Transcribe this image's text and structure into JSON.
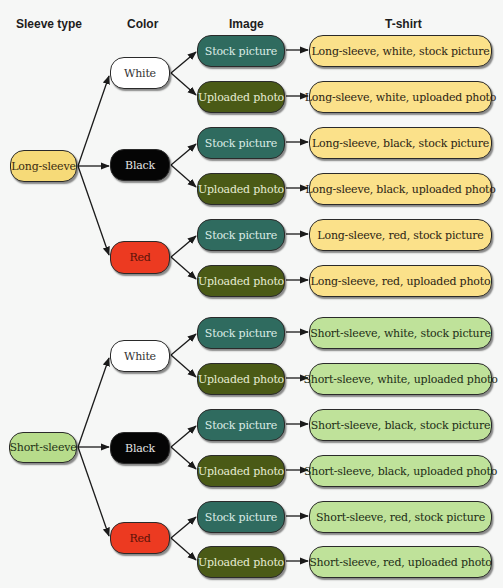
{
  "headers": {
    "sleeve_type": "Sleeve type",
    "color": "Color",
    "image": "Image",
    "tshirt": "T-shirt"
  },
  "colors_hex": {
    "long_sleeve": "#f6da78",
    "short_sleeve": "#b7dc8b",
    "white": "#ffffff",
    "black": "#050505",
    "red": "#ec3a21",
    "stock_picture": "#2f6b5f",
    "uploaded_photo": "#4a5a16"
  },
  "tree": [
    {
      "sleeve": "Long-sleeve",
      "colors": [
        {
          "color": "White",
          "images": [
            {
              "image": "Stock picture",
              "tshirt": "Long-sleeve, white, stock picture"
            },
            {
              "image": "Uploaded photo",
              "tshirt": "Long-sleeve, white, uploaded photo"
            }
          ]
        },
        {
          "color": "Black",
          "images": [
            {
              "image": "Stock picture",
              "tshirt": "Long-sleeve, black, stock picture"
            },
            {
              "image": "Uploaded photo",
              "tshirt": "Long-sleeve, black, uploaded photo"
            }
          ]
        },
        {
          "color": "Red",
          "images": [
            {
              "image": "Stock picture",
              "tshirt": "Long-sleeve, red, stock picture"
            },
            {
              "image": "Uploaded photo",
              "tshirt": "Long-sleeve, red, uploaded photo"
            }
          ]
        }
      ]
    },
    {
      "sleeve": "Short-sleeve",
      "colors": [
        {
          "color": "White",
          "images": [
            {
              "image": "Stock picture",
              "tshirt": "Short-sleeve, white, stock picture"
            },
            {
              "image": "Uploaded photo",
              "tshirt": "Short-sleeve, white, uploaded photo"
            }
          ]
        },
        {
          "color": "Black",
          "images": [
            {
              "image": "Stock picture",
              "tshirt": "Short-sleeve, black, stock picture"
            },
            {
              "image": "Uploaded photo",
              "tshirt": "Short-sleeve, black, uploaded photo"
            }
          ]
        },
        {
          "color": "Red",
          "images": [
            {
              "image": "Stock picture",
              "tshirt": "Short-sleeve, red, stock picture"
            },
            {
              "image": "Uploaded photo",
              "tshirt": "Short-sleeve, red, uploaded photo"
            }
          ]
        }
      ]
    }
  ]
}
